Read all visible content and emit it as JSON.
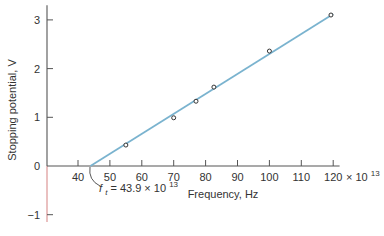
{
  "chart_data": {
    "type": "scatter",
    "title": "",
    "xlabel": "Frequency, Hz",
    "ylabel": "Stopping potential, V",
    "x_multiplier_label": "× 10",
    "x_multiplier_exp": "13",
    "xlim": [
      35,
      125
    ],
    "ylim": [
      -1.2,
      3.3
    ],
    "x_ticks": [
      40,
      50,
      60,
      70,
      80,
      90,
      100,
      110,
      120
    ],
    "y_ticks": [
      -1,
      0,
      1,
      2,
      3
    ],
    "grid": false,
    "legend": null,
    "series": [
      {
        "name": "measured",
        "type": "scatter",
        "marker": "open-circle",
        "color": "#333333",
        "x": [
          55,
          70,
          77,
          82.6,
          100,
          119.3
        ],
        "y": [
          0.43,
          0.99,
          1.33,
          1.62,
          2.36,
          3.1
        ]
      },
      {
        "name": "fit",
        "type": "line",
        "color": "#7ab3cf",
        "x": [
          43.9,
          120
        ],
        "y": [
          0,
          3.12
        ]
      }
    ],
    "annotations": [
      {
        "text_prefix": "f",
        "text_sub": "t",
        "text_main": " = 43.9 × 10",
        "text_sup": "13",
        "x": 43.9,
        "y": 0
      }
    ]
  },
  "colors": {
    "axis": "#555555",
    "fit_line": "#7ab3cf",
    "negative_axis": "#d98c8c"
  }
}
